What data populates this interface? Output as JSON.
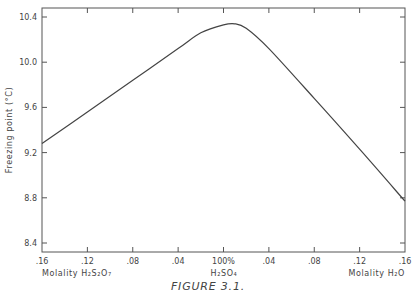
{
  "figure": {
    "caption": "FIGURE 3.1."
  },
  "chart_data": {
    "type": "line",
    "title": "",
    "caption": "FIGURE 3.1.",
    "ylabel": "Freezing point (°C)",
    "xlabel_left": "Molality H₂S₂O₇",
    "xlabel_center": "H₂SO₄",
    "xlabel_right": "Molality H₂O",
    "ylim": [
      8.3,
      10.5
    ],
    "yticks": [
      "10.4",
      "10.0",
      "9.6",
      "9.2",
      "8.8",
      "8.4"
    ],
    "xticks": [
      ".16",
      ".12",
      ".08",
      ".04",
      "100%",
      ".04",
      ".08",
      ".12",
      ".16"
    ],
    "x_axis_note": "Left half: molality of H2S2O7 (decreasing toward 100% H2SO4); right half: molality of H2O (increasing away from 100% H2SO4). Plotted as signed position: negative = H2S2O7, positive = H2O.",
    "grid": false,
    "legend": null,
    "series": [
      {
        "name": "Freezing point",
        "x": [
          -0.16,
          -0.12,
          -0.08,
          -0.04,
          -0.02,
          0.0,
          0.01,
          0.02,
          0.04,
          0.08,
          0.12,
          0.16
        ],
        "values": [
          9.28,
          9.56,
          9.84,
          10.12,
          10.26,
          10.33,
          10.34,
          10.3,
          10.12,
          9.68,
          9.23,
          8.77
        ]
      }
    ]
  }
}
